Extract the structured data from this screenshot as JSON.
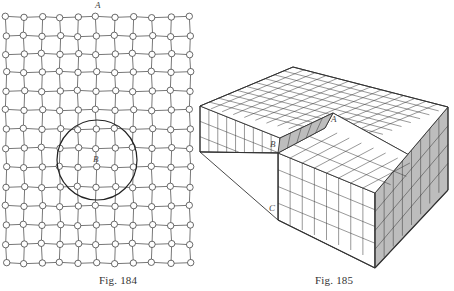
{
  "figures": [
    {
      "id": "fig184",
      "caption": "Fig. 184",
      "caption_pos": [
        99,
        281
      ],
      "labels": [
        {
          "text": "A",
          "x": 95,
          "y": 9
        },
        {
          "text": "B",
          "x": 96,
          "y": 160
        }
      ],
      "lattice": {
        "columns": [
          6,
          24,
          42,
          60,
          78,
          96,
          115,
          133,
          152,
          171,
          190
        ],
        "rows": [
          17,
          36,
          54,
          72,
          91,
          110,
          129,
          148,
          167,
          187,
          206,
          225,
          244,
          263
        ],
        "node_radius": 3.2,
        "circle": {
          "cx": 97,
          "cy": 160,
          "r": 40
        }
      }
    },
    {
      "id": "fig185",
      "caption": "Fig. 185",
      "caption_pos": [
        315,
        281
      ],
      "labels": [
        {
          "text": "B",
          "x": 273,
          "y": 146
        },
        {
          "text": "A",
          "x": 333,
          "y": 122
        },
        {
          "text": "C",
          "x": 271,
          "y": 212
        }
      ],
      "block": {
        "top_back": [
          293,
          67
        ],
        "top_left": [
          200,
          106
        ],
        "top_right": [
          448,
          107
        ],
        "front_top": [
          375,
          193
        ],
        "front_bottom": [
          375,
          268
        ],
        "right_bottom": [
          448,
          190
        ],
        "left_bottom": [
          200,
          152
        ],
        "step_left_top": [
          278,
          153
        ],
        "step_left_bottom": [
          278,
          220
        ],
        "notch_B": [
          280,
          138
        ],
        "notch_A": [
          333,
          113
        ],
        "notch_bottom_end": [
          325,
          128
        ],
        "face_shade": "#bdbdbd",
        "line_color": "#333333"
      }
    }
  ]
}
